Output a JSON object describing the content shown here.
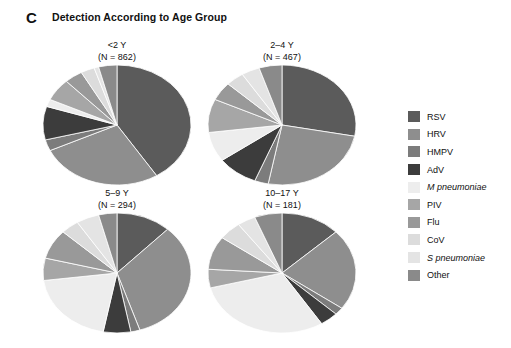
{
  "header": {
    "panel_letter": "C",
    "title": "Detection According to Age Group"
  },
  "legend": {
    "items": [
      {
        "label": "RSV",
        "color": "#5b5b5b",
        "italic": false
      },
      {
        "label": "HRV",
        "color": "#8e8e8e",
        "italic": false
      },
      {
        "label": "HMPV",
        "color": "#7c7c7c",
        "italic": false
      },
      {
        "label": "AdV",
        "color": "#3c3c3c",
        "italic": false
      },
      {
        "label": "M pneumoniae",
        "color": "#ededed",
        "italic": true
      },
      {
        "label": "PIV",
        "color": "#a6a6a6",
        "italic": false
      },
      {
        "label": "Flu",
        "color": "#999999",
        "italic": false
      },
      {
        "label": "CoV",
        "color": "#dcdcdc",
        "italic": false
      },
      {
        "label": "S pneumoniae",
        "color": "#e4e4e4",
        "italic": true
      },
      {
        "label": "Other",
        "color": "#8a8a8a",
        "italic": false
      }
    ]
  },
  "chart_data": [
    {
      "type": "pie",
      "title": "<2 Y",
      "subtitle": "(N = 862)",
      "n": 862,
      "categories": [
        "RSV",
        "HRV",
        "HMPV",
        "AdV",
        "M pneumoniae",
        "PIV",
        "Flu",
        "CoV",
        "S pneumoniae",
        "Other"
      ],
      "values": [
        41,
        27,
        3,
        9,
        2,
        6,
        4,
        3,
        1,
        4
      ],
      "start_angle": 0
    },
    {
      "type": "pie",
      "title": "2–4 Y",
      "subtitle": "(N = 467)",
      "n": 467,
      "categories": [
        "RSV",
        "HRV",
        "HMPV",
        "AdV",
        "M pneumoniae",
        "PIV",
        "Flu",
        "CoV",
        "S pneumoniae",
        "Other"
      ],
      "values": [
        28,
        25,
        3,
        9,
        8,
        9,
        5,
        4,
        4,
        5
      ],
      "start_angle": 0
    },
    {
      "type": "pie",
      "title": "5–9 Y",
      "subtitle": "(N = 294)",
      "n": 294,
      "categories": [
        "RSV",
        "HRV",
        "HMPV",
        "AdV",
        "M pneumoniae",
        "PIV",
        "Flu",
        "CoV",
        "S pneumoniae",
        "Other"
      ],
      "values": [
        12,
        33,
        2,
        6,
        20,
        6,
        8,
        4,
        5,
        4
      ],
      "start_angle": 0
    },
    {
      "type": "pie",
      "title": "10–17 Y",
      "subtitle": "(N = 181)",
      "n": 181,
      "categories": [
        "RSV",
        "HRV",
        "HMPV",
        "AdV",
        "M pneumoniae",
        "PIV",
        "Flu",
        "CoV",
        "S pneumoniae",
        "Other"
      ],
      "values": [
        13,
        22,
        2,
        4,
        30,
        5,
        9,
        5,
        4,
        6
      ],
      "start_angle": 0
    }
  ]
}
